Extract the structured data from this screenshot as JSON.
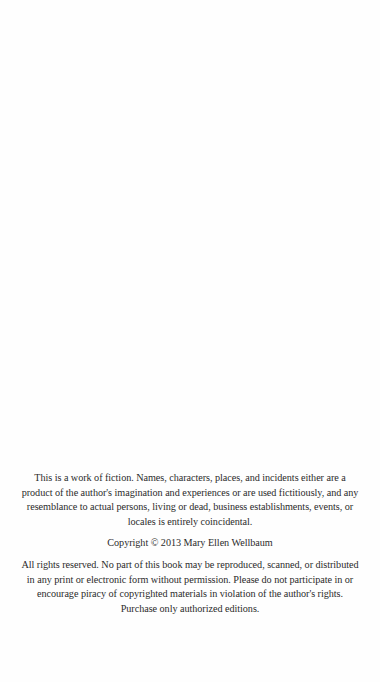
{
  "page": {
    "type": "copyright-page",
    "background_color": "#fefefe",
    "text_color": "#2b2b2b"
  },
  "fiction_notice": {
    "lines": [
      "This is a work of fiction.  Names, characters, places, and incidents either are a",
      "product of the author's imagination and experiences or are used fictitiously, and any",
      "resemblance to actual persons, living or dead, business establishments, events, or",
      "locales is entirely coincidental."
    ]
  },
  "copyright": {
    "text": "Copyright © 2013   Mary Ellen Wellbaum",
    "year": "2013",
    "author": "Mary Ellen Wellbaum"
  },
  "rights_notice": {
    "lines": [
      "All rights reserved.  No part of this book may be reproduced, scanned, or distributed",
      "in any print or electronic form without permission.  Please do not participate in or",
      "encourage piracy of copyrighted materials in violation of the author's rights.",
      "Purchase only authorized editions."
    ]
  }
}
